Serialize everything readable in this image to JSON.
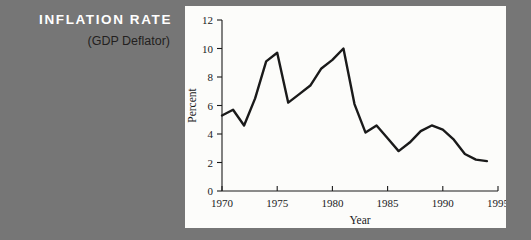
{
  "caption": {
    "title": "INFLATION RATE",
    "subtitle": "(GDP Deflator)",
    "title_color": "#ffffff",
    "subtitle_color": "#231f20"
  },
  "background_color": "#767676",
  "panel_color": "#fcfcfa",
  "chart_data": {
    "type": "line",
    "title": "INFLATION RATE",
    "subtitle": "(GDP Deflator)",
    "xlabel": "Year",
    "ylabel": "Percent",
    "xlim": [
      1970,
      1995
    ],
    "ylim": [
      0,
      12
    ],
    "xticks": [
      1970,
      1975,
      1980,
      1985,
      1990,
      1995
    ],
    "xtick_labels": [
      "1970",
      "1975",
      "1980",
      "1985",
      "1990",
      "1995"
    ],
    "yticks": [
      0,
      2,
      4,
      6,
      8,
      10,
      12
    ],
    "ytick_labels": [
      "0",
      "2",
      "4",
      "6",
      "8",
      "10",
      "12"
    ],
    "grid": false,
    "legend": false,
    "line_color": "#1a1a1a",
    "line_width": 2.4,
    "x": [
      1970,
      1971,
      1972,
      1973,
      1974,
      1975,
      1976,
      1977,
      1978,
      1979,
      1980,
      1981,
      1982,
      1983,
      1984,
      1985,
      1986,
      1987,
      1988,
      1989,
      1990,
      1991,
      1992,
      1993,
      1994
    ],
    "values": [
      5.3,
      5.7,
      4.6,
      6.5,
      9.1,
      9.7,
      6.2,
      6.8,
      7.4,
      8.6,
      9.2,
      10.0,
      6.1,
      4.1,
      4.6,
      3.7,
      2.8,
      3.4,
      4.2,
      4.6,
      4.3,
      3.6,
      2.6,
      2.2,
      2.1
    ],
    "series": [
      {
        "name": "GDP Deflator inflation rate",
        "values": [
          5.3,
          5.7,
          4.6,
          6.5,
          9.1,
          9.7,
          6.2,
          6.8,
          7.4,
          8.6,
          9.2,
          10.0,
          6.1,
          4.1,
          4.6,
          3.7,
          2.8,
          3.4,
          4.2,
          4.6,
          4.3,
          3.6,
          2.6,
          2.2,
          2.1
        ]
      }
    ],
    "annotations": []
  }
}
